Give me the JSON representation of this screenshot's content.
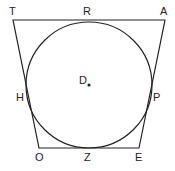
{
  "diagram": {
    "type": "circle inscribed in trapezoid",
    "colors": {
      "stroke": "#222222",
      "background": "#ffffff"
    },
    "vertices": [
      {
        "name": "T",
        "x": 13,
        "y": 20
      },
      {
        "name": "A",
        "x": 165,
        "y": 20
      },
      {
        "name": "E",
        "x": 139,
        "y": 148
      },
      {
        "name": "O",
        "x": 39,
        "y": 148
      }
    ],
    "circle": {
      "center_label": "D",
      "cx": 89,
      "cy": 85,
      "r": 63
    },
    "tangent_points": [
      "R",
      "P",
      "Z",
      "H"
    ],
    "labels": {
      "T": "T",
      "R": "R",
      "A": "A",
      "D": "D",
      "H": "H",
      "P": "P",
      "O": "O",
      "Z": "Z",
      "E": "E"
    }
  }
}
